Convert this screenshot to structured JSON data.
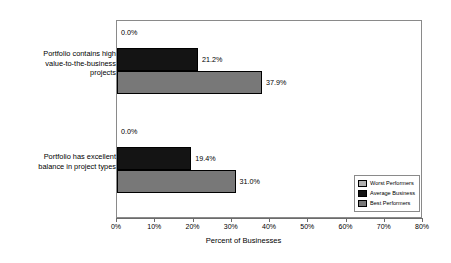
{
  "chart_data": {
    "type": "bar",
    "orientation": "horizontal",
    "title": "",
    "xlabel": "Percent of Businesses",
    "ylabel": "",
    "xlim": [
      0,
      80
    ],
    "xticks": [
      "0%",
      "10%",
      "20%",
      "30%",
      "40%",
      "50%",
      "60%",
      "70%",
      "80%"
    ],
    "xtick_values": [
      0,
      10,
      20,
      30,
      40,
      50,
      60,
      70,
      80
    ],
    "grid": false,
    "legend_position": "bottom-right",
    "categories": [
      "Portfolio contains high value-to-the-business projects",
      "Portfolio has excellent balance in project types"
    ],
    "category_lines": [
      [
        "Portfolio contains high",
        "value-to-the-business",
        "projects"
      ],
      [
        "Portfolio has excellent",
        "balance in project types"
      ]
    ],
    "series": [
      {
        "name": "Best Performers",
        "color": "#787878",
        "values": [
          0.0,
          0.0
        ],
        "labels": [
          "0.0%",
          "0.0%"
        ]
      },
      {
        "name": "Average Business",
        "color": "#141414",
        "values": [
          21.2,
          19.4
        ],
        "labels": [
          "21.2%",
          "19.4%"
        ]
      },
      {
        "name": "Worst Performers",
        "color": "#787878",
        "values": [
          37.9,
          31.0
        ],
        "labels": [
          "37.9%",
          "31.0%"
        ]
      }
    ],
    "legend": [
      {
        "label": "Worst Performers",
        "color": "#b0b0b0"
      },
      {
        "label": "Average Business",
        "color": "#141414"
      },
      {
        "label": "Best Performers",
        "color": "#787878"
      }
    ],
    "bar_order_top_to_bottom": [
      "Best Performers",
      "Average Business",
      "Worst Performers"
    ]
  }
}
